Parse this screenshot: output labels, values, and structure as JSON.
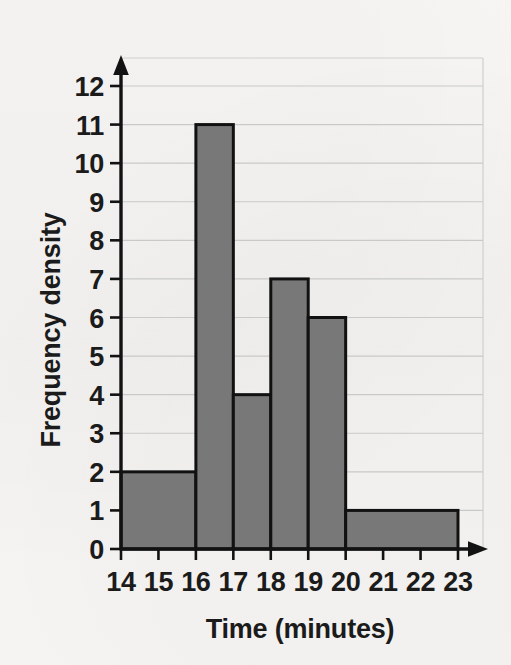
{
  "chart_data": {
    "type": "bar",
    "subtype": "histogram",
    "title": "",
    "xlabel": "Time (minutes)",
    "ylabel": "Frequency density",
    "xlim": [
      14,
      23
    ],
    "ylim": [
      0,
      12
    ],
    "xticks": [
      "14",
      "15",
      "16",
      "17",
      "18",
      "19",
      "20",
      "21",
      "22",
      "23"
    ],
    "yticks": [
      "0",
      "1",
      "2",
      "3",
      "4",
      "5",
      "6",
      "7",
      "8",
      "9",
      "10",
      "11",
      "12"
    ],
    "grid": "horizontal",
    "legend": "none",
    "bins": [
      {
        "label": "14-16",
        "start": 14,
        "end": 16,
        "value": 2
      },
      {
        "label": "16-17",
        "start": 16,
        "end": 17,
        "value": 11
      },
      {
        "label": "17-18",
        "start": 17,
        "end": 18,
        "value": 4
      },
      {
        "label": "18-19",
        "start": 18,
        "end": 19,
        "value": 7
      },
      {
        "label": "19-20",
        "start": 19,
        "end": 20,
        "value": 6
      },
      {
        "label": "20-23",
        "start": 20,
        "end": 23,
        "value": 1
      }
    ],
    "colors": {
      "bar_fill": "#787878",
      "bar_stroke": "#111111",
      "axis": "#121212",
      "gridline": "#c9c9c9",
      "background": "#f6f5f3",
      "text": "#1b1b1b"
    }
  }
}
